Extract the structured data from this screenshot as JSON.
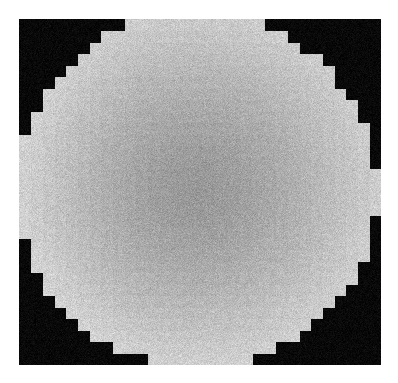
{
  "page": {
    "width": 398,
    "height": 383,
    "background_color": "#ffffff",
    "kind": "grayscale-scan"
  },
  "figure": {
    "name": "pixelated-disk-phantom",
    "frame": {
      "x": 19,
      "y": 19,
      "width": 362,
      "height": 346
    },
    "background_color": "#0d0d0d",
    "colors": {
      "background_dark": "#0a0a0a",
      "disk_core": "#9c9c9c",
      "disk_rim": "#c4c4c4",
      "disk_bottom_highlight": "#cfcfcf",
      "paper_white": "#ffffff"
    }
  },
  "chart_data": {
    "type": "heatmap",
    "title": "",
    "subtitle": "",
    "xlabel": "",
    "ylabel": "",
    "grid": false,
    "legend": "none",
    "colormap": "grayscale",
    "value_range": [
      0,
      255
    ],
    "raster": {
      "block_size_px": 11.6,
      "columns": 31,
      "rows": 30,
      "disk_center_col": 15.2,
      "disk_center_row": 14.8,
      "disk_radius_blocks": 15.4,
      "inside_value": 156,
      "rim_value": 196,
      "outside_value": 10,
      "noise_sigma_inside": 13,
      "noise_sigma_outside": 7
    },
    "gradient_stops": [
      {
        "position": 0.0,
        "value": 205
      },
      {
        "position": 0.45,
        "value": 176
      },
      {
        "position": 0.78,
        "value": 158
      },
      {
        "position": 1.0,
        "value": 152
      }
    ]
  },
  "annotations": {
    "left_notch_label": "",
    "top_gap_label": ""
  }
}
